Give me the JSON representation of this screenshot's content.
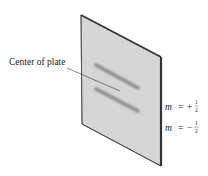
{
  "diagram": {
    "label_center": "Center of plate",
    "states": [
      {
        "var": "m",
        "eq": "=",
        "sign": "+",
        "num": "1",
        "den": "2"
      },
      {
        "var": "m",
        "eq": "=",
        "sign": "−",
        "num": "1",
        "den": "2"
      }
    ],
    "colors": {
      "plate_fill": "#d6d6d6",
      "plate_edge": "#444444",
      "band": "#8a8a8a",
      "leader": "#333333"
    }
  }
}
